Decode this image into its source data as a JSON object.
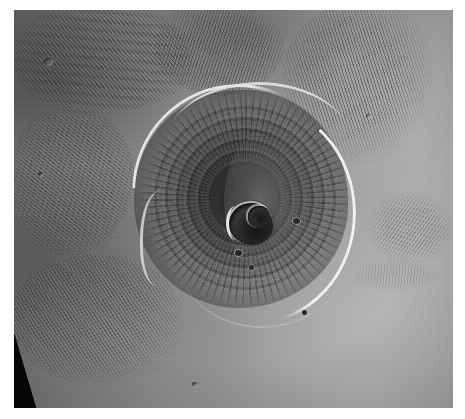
{
  "image": {
    "kind": "orbital-photograph",
    "subject": "Olympus Mons shield volcano",
    "body": "Mars",
    "palette": "grayscale",
    "alt_text": "Grayscale orbital photograph of Olympus Mons on Mars, showing the circular shield volcano with a complex summit caldera at its center, a bright basal escarpment ringing the northwest and east flanks, and ridged aureole terrain on the surrounding plains.",
    "frame": {
      "background_color": "#ffffff",
      "left_margin_px": 14,
      "top_margin_px": 10,
      "photo_width_px": 439,
      "photo_height_px": 398
    },
    "colors": {
      "plains_light": "#adaba4",
      "plains_mid": "#8c8a84",
      "aureole_dark": "#3a3a37",
      "shield_dark": "#262624",
      "caldera_floor": "#1c1c1a",
      "scarp_highlight": "#ecea e2",
      "data_gap": "#090909"
    },
    "features": [
      {
        "name": "shield-volcano",
        "label": "Olympus Mons shield",
        "center": [
          245,
          199
        ],
        "radius_px": 107,
        "tone": "dark"
      },
      {
        "name": "summit-caldera",
        "label": "summit caldera complex",
        "center": [
          245,
          224
        ],
        "width_px": 44,
        "height_px": 42,
        "tone": "very-dark"
      },
      {
        "name": "basal-scarp-northwest",
        "label": "northwest basal escarpment",
        "tone": "bright"
      },
      {
        "name": "basal-scarp-east",
        "label": "east basal escarpment",
        "tone": "bright"
      },
      {
        "name": "aureole-northwest",
        "label": "ridged aureole terrain, northwest",
        "tone": "dark-textured"
      },
      {
        "name": "aureole-north",
        "label": "ridged aureole terrain, north",
        "tone": "dark-textured"
      },
      {
        "name": "aureole-northeast",
        "label": "ridged aureole terrain, northeast",
        "tone": "dark-textured"
      },
      {
        "name": "aureole-west",
        "label": "ridged aureole terrain, west",
        "tone": "dark-textured"
      },
      {
        "name": "aureole-southwest",
        "label": "ridged aureole terrain, southwest",
        "tone": "dark-textured"
      },
      {
        "name": "aureole-east",
        "label": "ridged patch, east plains",
        "tone": "mid-textured"
      },
      {
        "name": "plains-east",
        "label": "smooth lava plains, east",
        "tone": "light"
      },
      {
        "name": "data-gap-wedge",
        "label": "missing data wedge, lower left",
        "tone": "black"
      }
    ]
  }
}
